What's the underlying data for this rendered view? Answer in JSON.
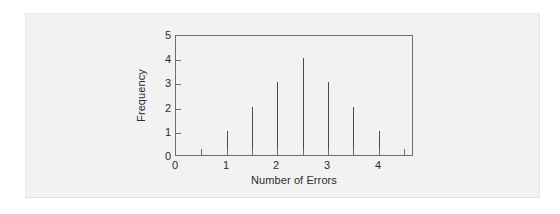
{
  "figure": {
    "card_background": "#f2f2f2",
    "page_background": "#ffffff"
  },
  "chart_data": {
    "type": "bar",
    "title": "",
    "subtitle": "",
    "xlabel": "Number of Errors",
    "ylabel": "Frequency",
    "x": [
      1,
      1.5,
      2,
      2.5,
      3,
      3.5,
      4
    ],
    "values": [
      1,
      2,
      3,
      4,
      3,
      2,
      1
    ],
    "categories": [
      "1",
      "1.5",
      "2",
      "2.5",
      "3",
      "3.5",
      "4"
    ],
    "xlim": [
      0,
      4.7
    ],
    "ylim": [
      0,
      5
    ],
    "xticks": [
      0,
      1,
      2,
      3,
      4
    ],
    "xtick_labels": [
      "0",
      "1",
      "2",
      "3",
      "4"
    ],
    "yticks": [
      0,
      1,
      2,
      3,
      4,
      5
    ],
    "ytick_labels": [
      "0",
      "1",
      "2",
      "3",
      "4",
      "5"
    ],
    "grid": false,
    "legend": null,
    "series_color": "#4a4a4a",
    "axis_color": "#6d6d6d",
    "bar_style": "thin-spike",
    "annotations": []
  }
}
